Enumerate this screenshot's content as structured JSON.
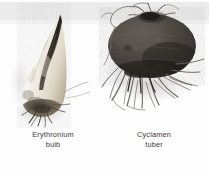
{
  "figure": {
    "background_color": "#fdfdfd",
    "band_color": "#ebebeb",
    "caption_color": "#3b3b3b",
    "specimens": [
      {
        "id": "erythronium-bulb",
        "genus_line": "Erythronium",
        "organ_line": "bulb",
        "body_color": "#efece4",
        "tip_color": "#2e2c29",
        "root_color": "#4a433a",
        "shape": "elongated-tapered-tooth",
        "label_align": "center"
      },
      {
        "id": "cyclamen-tuber",
        "genus_line": "Cyclamen",
        "organ_line": "tuber",
        "body_color": "#4a4642",
        "tip_color": "#241f1c",
        "root_color": "#6d665c",
        "shape": "flattened-oblate-disc",
        "label_align": "center"
      }
    ]
  }
}
